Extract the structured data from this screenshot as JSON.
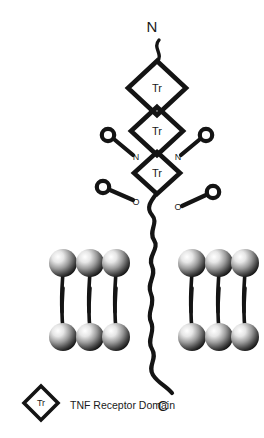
{
  "figure": {
    "background_color": "#ffffff",
    "stroke_color": "#141414",
    "text_color": "#1a1a1a"
  },
  "termini": {
    "n_terminus": "N",
    "c_terminus": "C"
  },
  "receptor_domains": [
    {
      "label": "Tr",
      "cx": 157,
      "cy": 88,
      "rx": 29,
      "ry": 27
    },
    {
      "label": "Tr",
      "cx": 157,
      "cy": 131,
      "rx": 26,
      "ry": 24
    },
    {
      "label": "Tr",
      "cx": 157,
      "cy": 173,
      "rx": 23,
      "ry": 21
    }
  ],
  "glycans": [
    {
      "type": "n-linked",
      "label": "N",
      "side": "left",
      "circle_cx": 108,
      "circle_cy": 135,
      "label_x": 136,
      "label_y": 159
    },
    {
      "type": "n-linked",
      "label": "N",
      "side": "right",
      "circle_cx": 206,
      "circle_cy": 135,
      "label_x": 178,
      "label_y": 159
    },
    {
      "type": "o-linked",
      "label": "O",
      "side": "left",
      "circle_cx": 103,
      "circle_cy": 187,
      "label_x": 136,
      "label_y": 204
    },
    {
      "type": "o-linked",
      "label": "O",
      "side": "right",
      "circle_cx": 213,
      "circle_cy": 192,
      "label_x": 178,
      "label_y": 209
    }
  ],
  "membrane": {
    "description": "lipid bilayer",
    "left_leaflet_upper_x": [
      63,
      90,
      116
    ],
    "left_leaflet_lower_x": [
      63,
      90,
      116
    ],
    "right_leaflet_upper_x": [
      192,
      219,
      245
    ],
    "right_leaflet_lower_x": [
      192,
      219,
      245
    ],
    "upper_head_cy": 263,
    "lower_head_cy": 337,
    "head_radius": 14
  },
  "legend": {
    "symbol_label": "Tr",
    "description": "TNF Receptor Domain"
  }
}
